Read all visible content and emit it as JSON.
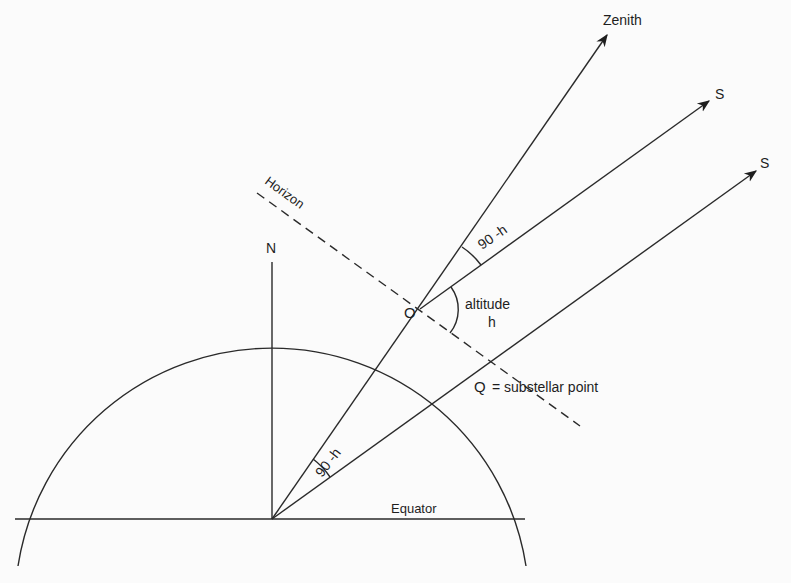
{
  "diagram": {
    "title": "",
    "labels": {
      "zenith": "Zenith",
      "star_upper": "S",
      "star_lower": "S",
      "horizon": "Horizon",
      "north": "N",
      "observer": "O",
      "altitude_word": "altitude",
      "altitude_symbol": "h",
      "zenith_angle_upper": "90 -h",
      "zenith_angle_lower": "90 -h",
      "substellar": "Q",
      "substellar_desc": "= substellar  point",
      "equator": "Equator"
    },
    "colors": {
      "background": "#fbfbfb",
      "ink": "#2a2a2a"
    }
  }
}
